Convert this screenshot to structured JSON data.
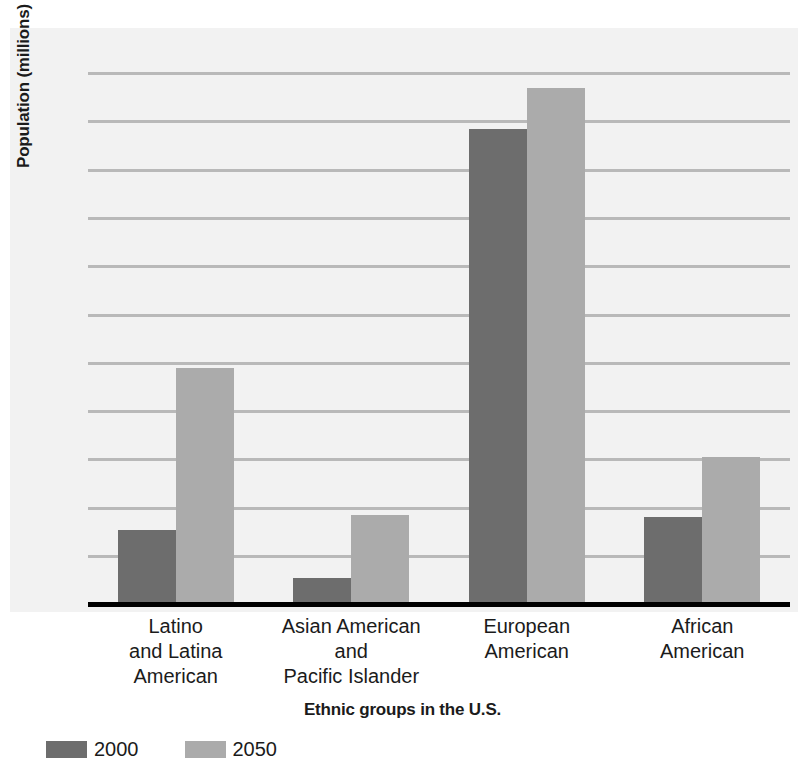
{
  "chart_data": {
    "type": "bar",
    "title": "",
    "xlabel": "Ethnic groups in the U.S.",
    "ylabel": "Population (millions)",
    "categories": [
      "Latino\nand Latina\nAmerican",
      "Asian American\nand\nPacific Islander",
      "European\nAmerican",
      "African\nAmerican"
    ],
    "category_lines": [
      [
        "Latino",
        "and Latina",
        "American"
      ],
      [
        "Asian American",
        "and",
        "Pacific Islander"
      ],
      [
        "European",
        "American"
      ],
      [
        "African",
        "American"
      ]
    ],
    "series": [
      {
        "name": "2000",
        "color": "#6d6d6d",
        "values": [
          31.0,
          11.0,
          197.0,
          36.0
        ]
      },
      {
        "name": "2050",
        "color": "#ababab",
        "values": [
          98.0,
          37.0,
          214.0,
          61.0
        ]
      }
    ],
    "ylim": [
      1.0,
      220.0
    ],
    "ytick_labels": [
      "220.0",
      "200.0",
      "180.0",
      "160.0",
      "140.0",
      "120.0",
      "100.0",
      "80.0",
      "60.0",
      "40.0",
      "20.0",
      "1.0"
    ],
    "ytick_values": [
      220.0,
      200.0,
      180.0,
      160.0,
      140.0,
      120.0,
      100.0,
      80.0,
      60.0,
      40.0,
      20.0,
      1.0
    ],
    "grid": true,
    "grid_color": "#b9b9b9",
    "legend_position": "bottom-left",
    "axis_color": "#000000",
    "background": "#f2f2f2"
  },
  "axes": {
    "y_title": "Population (millions)",
    "x_title": "Ethnic groups in the U.S."
  },
  "legend": {
    "items": [
      {
        "label": "2000",
        "color": "#6d6d6d"
      },
      {
        "label": "2050",
        "color": "#ababab"
      }
    ]
  }
}
